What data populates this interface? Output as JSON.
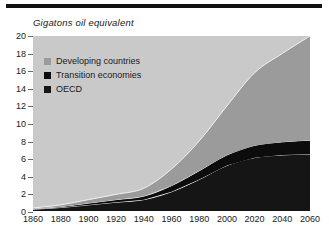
{
  "chart_data": {
    "type": "area",
    "stacked": true,
    "title": "Gigatons oil equivalent",
    "xlabel": "",
    "ylabel": "Gigatons oil equivalent",
    "xlim": [
      1860,
      2060
    ],
    "ylim": [
      0,
      20
    ],
    "grid": false,
    "legend_position": "upper-left-inside",
    "x": [
      1860,
      1880,
      1900,
      1920,
      1940,
      1960,
      1980,
      2000,
      2020,
      2040,
      2060
    ],
    "xticklabels": [
      "1860",
      "1880",
      "1900",
      "1920",
      "1940",
      "1960",
      "1980",
      "2000",
      "2020",
      "2040",
      "2060"
    ],
    "yticklabels": [
      "0",
      "2",
      "4",
      "6",
      "8",
      "10",
      "12",
      "14",
      "16",
      "18",
      "20"
    ],
    "yticks": [
      0,
      2,
      4,
      6,
      8,
      10,
      12,
      14,
      16,
      18,
      20
    ],
    "series": [
      {
        "name": "OECD",
        "color": "#151515",
        "order": 1,
        "values": [
          0.2,
          0.4,
          0.7,
          1.0,
          1.3,
          2.2,
          3.6,
          5.2,
          6.1,
          6.4,
          6.5
        ]
      },
      {
        "name": "Transition economies",
        "color": "#0c0c0c",
        "order": 2,
        "values": [
          0.05,
          0.1,
          0.2,
          0.3,
          0.4,
          0.7,
          1.0,
          1.2,
          1.4,
          1.5,
          1.6
        ]
      },
      {
        "name": "Developing countries",
        "color": "#9b9b9b",
        "order": 3,
        "values": [
          0.1,
          0.2,
          0.4,
          0.6,
          0.9,
          1.9,
          3.4,
          5.6,
          8.3,
          10.1,
          11.9
        ]
      }
    ],
    "totals": [
      0.35,
      0.7,
      1.3,
      1.9,
      2.6,
      4.8,
      8.0,
      12.0,
      15.8,
      18.0,
      20.0
    ]
  },
  "legend": {
    "items": [
      {
        "label": "Developing countries",
        "color": "#9b9b9b"
      },
      {
        "label": "Transition economies",
        "color": "#0c0c0c"
      },
      {
        "label": "OECD",
        "color": "#151515"
      }
    ]
  },
  "colors": {
    "plot_background": "#c9c9c9",
    "page_background": "#ffffff",
    "rule": "#111111",
    "text": "#1a1a1a",
    "separator": "#f2f2f2"
  }
}
